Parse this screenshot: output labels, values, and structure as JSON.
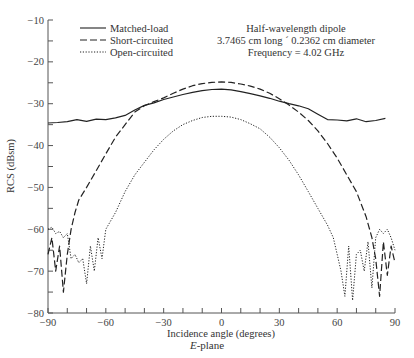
{
  "chart_data": {
    "type": "line",
    "title": "",
    "xlabel": "Incidence angle (degrees)",
    "ylabel": "RCS (dBsm)",
    "xlim": [
      -90,
      90
    ],
    "ylim": [
      -80,
      -10
    ],
    "xticks": [
      -90,
      -60,
      -30,
      0,
      30,
      60,
      90
    ],
    "xminor": [
      -80,
      -70,
      -50,
      -40,
      -20,
      -10,
      10,
      20,
      40,
      50,
      70,
      80
    ],
    "yticks": [
      -10,
      -20,
      -30,
      -40,
      -50,
      -60,
      -70,
      -80
    ],
    "yminor": [
      -15,
      -25,
      -35,
      -45,
      -55,
      -65,
      -75
    ],
    "grid": false,
    "legend_position": "upper-left",
    "annotation": [
      "Half-wavelength dipole",
      "3.7465 cm long ´ 0.2362 cm diameter",
      "Frequency = 4.02 GHz"
    ],
    "subtitle_below": "E-plane",
    "series": [
      {
        "name": "Matched-load",
        "style": "solid",
        "x": [
          -90,
          -85,
          -80,
          -75,
          -70,
          -65,
          -60,
          -55,
          -50,
          -45,
          -40,
          -35,
          -30,
          -25,
          -20,
          -15,
          -10,
          -5,
          0,
          5,
          10,
          15,
          20,
          25,
          30,
          35,
          40,
          45,
          50,
          55,
          60,
          65,
          70,
          75,
          80,
          85
        ],
        "y": [
          -34.6,
          -34.5,
          -34.3,
          -33.8,
          -34.2,
          -33.7,
          -33.8,
          -33.4,
          -32.8,
          -31.5,
          -30.4,
          -29.8,
          -29.0,
          -28.4,
          -27.8,
          -27.3,
          -26.9,
          -26.6,
          -26.5,
          -26.7,
          -27.1,
          -27.6,
          -28.1,
          -28.7,
          -29.4,
          -30.0,
          -30.5,
          -31.2,
          -32.5,
          -33.8,
          -33.9,
          -34.1,
          -33.6,
          -34.3,
          -34.0,
          -33.5
        ]
      },
      {
        "name": "Short-circuited",
        "style": "dashed",
        "x": [
          -90,
          -88,
          -86,
          -84,
          -82,
          -80,
          -78,
          -76,
          -74,
          -70,
          -65,
          -60,
          -55,
          -50,
          -45,
          -40,
          -35,
          -30,
          -25,
          -20,
          -15,
          -10,
          -5,
          0,
          5,
          10,
          15,
          20,
          25,
          30,
          35,
          40,
          45,
          50,
          55,
          60,
          65,
          70,
          75,
          78,
          80,
          82,
          84,
          86,
          88,
          90
        ],
        "y": [
          -66,
          -62,
          -70,
          -64,
          -75,
          -66,
          -60,
          -56,
          -53,
          -50,
          -46,
          -42,
          -38,
          -35,
          -32,
          -30.5,
          -29.5,
          -28.6,
          -27.5,
          -26.5,
          -25.7,
          -25.2,
          -24.9,
          -24.8,
          -24.9,
          -25.3,
          -25.8,
          -26.5,
          -27.5,
          -28.8,
          -30.3,
          -32.0,
          -34.0,
          -36.5,
          -39.5,
          -43.0,
          -47.0,
          -51.0,
          -57.0,
          -62.0,
          -67.0,
          -76.0,
          -63.0,
          -71.0,
          -64.0,
          -68.0
        ]
      },
      {
        "name": "Open-circuited",
        "style": "dotted",
        "x": [
          -90,
          -88,
          -86,
          -84,
          -82,
          -80,
          -78,
          -76,
          -74,
          -72,
          -70,
          -68,
          -66,
          -64,
          -62,
          -60,
          -55,
          -50,
          -45,
          -40,
          -35,
          -30,
          -25,
          -20,
          -15,
          -10,
          -5,
          0,
          5,
          10,
          15,
          20,
          25,
          30,
          35,
          40,
          45,
          50,
          55,
          58,
          60,
          62,
          64,
          66,
          68,
          70,
          72,
          74,
          76,
          78,
          80,
          82,
          84,
          86,
          88,
          90
        ],
        "y": [
          -60,
          -59.5,
          -61,
          -60.5,
          -62,
          -61,
          -67,
          -66,
          -68,
          -67,
          -73,
          -64,
          -70,
          -62,
          -67,
          -60,
          -56,
          -51,
          -47,
          -44,
          -41,
          -38.5,
          -36.5,
          -35,
          -34,
          -33.3,
          -33.0,
          -33.0,
          -33.2,
          -33.8,
          -34.8,
          -36.0,
          -38.0,
          -40.5,
          -43.5,
          -47.0,
          -51.0,
          -55.0,
          -59.0,
          -62.0,
          -66.0,
          -70.0,
          -76.0,
          -64.0,
          -77.0,
          -66.0,
          -65.0,
          -70.0,
          -63.0,
          -74.0,
          -62.0,
          -60.0,
          -61.0,
          -60.0,
          -62.0,
          -65.0
        ]
      }
    ]
  },
  "legend": {
    "items": [
      {
        "label": "Matched-load",
        "style": "solid"
      },
      {
        "label": "Short-circuited",
        "style": "dashed"
      },
      {
        "label": "Open-circuited",
        "style": "dotted"
      }
    ]
  },
  "annotation": {
    "line1": "Half-wavelength dipole",
    "line2": "3.7465 cm long ´ 0.2362 cm diameter",
    "line3": "Frequency = 4.02 GHz"
  },
  "axes": {
    "xlabel": "Incidence angle (degrees)",
    "ylabel": "RCS (dBsm)"
  },
  "caption": {
    "plane_italic": "E",
    "plane_rest": "-plane"
  },
  "colors": {
    "line": "#222222",
    "axis": "#555555",
    "text": "#333333"
  }
}
